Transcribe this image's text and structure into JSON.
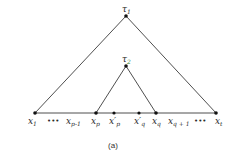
{
  "diagram": {
    "type": "tree-intervals",
    "caption": "(a)",
    "colors": {
      "line": "#222222",
      "node": "#111111",
      "tau2_subscript": "#3a8a3a"
    },
    "apexes": [
      {
        "id": "tau1",
        "label": "τ",
        "sub": "1",
        "x": 126,
        "y": 16
      },
      {
        "id": "tau2",
        "label": "τ",
        "sub": "2",
        "x": 126,
        "y": 66
      }
    ],
    "baseline_y": 113,
    "nodes": [
      {
        "id": "x1",
        "label": "x",
        "sub": "1",
        "x": 35,
        "dot": true
      },
      {
        "id": "dots1",
        "label": "•••",
        "sub": "",
        "x": 55,
        "dot": false
      },
      {
        "id": "xp-1",
        "label": "x",
        "sub": "p-1",
        "x": 72,
        "dot": false
      },
      {
        "id": "xp",
        "label": "x",
        "sub": "p",
        "x": 96,
        "dot": true
      },
      {
        "id": "x'p",
        "label": "x′",
        "sub": "p",
        "x": 114,
        "dot": true
      },
      {
        "id": "x'q",
        "label": "x′",
        "sub": "q",
        "x": 139,
        "dot": true
      },
      {
        "id": "xq",
        "label": "x",
        "sub": "q",
        "x": 156,
        "dot": true
      },
      {
        "id": "xq+1",
        "label": "x",
        "sub": "q+1",
        "x": 175,
        "dot": false
      },
      {
        "id": "dots2",
        "label": "•••",
        "sub": "",
        "x": 201,
        "dot": false
      },
      {
        "id": "xt",
        "label": "x",
        "sub": "t",
        "x": 216,
        "dot": true
      }
    ],
    "labels": {
      "tau1": "τ",
      "tau1_sub": "1",
      "tau2": "τ",
      "tau2_sub": "2",
      "x1": "x",
      "x1_sub": "1",
      "dots1": "•••",
      "xp1": "x",
      "xp1_sub": "p-1",
      "xp": "x",
      "xp_sub": "p",
      "xpp": "x′",
      "xpp_sub": "p",
      "xqp": "x′",
      "xqp_sub": "q",
      "xq": "x",
      "xq_sub": "q",
      "xq1": "x",
      "xq1_sub": "q + 1",
      "dots2": "•••",
      "xt": "x",
      "xt_sub": "t"
    }
  }
}
